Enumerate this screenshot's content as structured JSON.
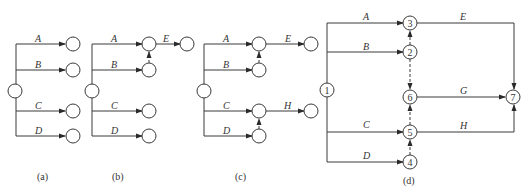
{
  "diagrams": {
    "a": {
      "caption": "(a)",
      "activities": [
        "A",
        "B",
        "C",
        "D"
      ]
    },
    "b": {
      "caption": "(b)",
      "activities": [
        "A",
        "B",
        "C",
        "D",
        "E"
      ]
    },
    "c": {
      "caption": "(c)",
      "activities": [
        "A",
        "B",
        "C",
        "D",
        "E",
        "H"
      ]
    },
    "d": {
      "caption": "(d)",
      "activities": [
        "A",
        "B",
        "C",
        "D",
        "E",
        "G",
        "H"
      ],
      "nodes": [
        "1",
        "2",
        "3",
        "4",
        "5",
        "6",
        "7"
      ]
    }
  },
  "colors": {
    "line": "#3a3a3a",
    "background": "#ffffff"
  }
}
